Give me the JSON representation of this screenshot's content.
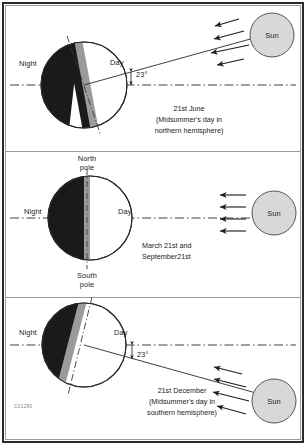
{
  "figure": {
    "reference_code": "C01290",
    "colors": {
      "night": "#1a1a1a",
      "day": "#ffffff",
      "terminator": "#9b9b9b",
      "sun_fill": "#d8d8d8",
      "outline": "#2a2a2a",
      "frame": "#2a2a2a",
      "axis_line": "#3a3a3a"
    }
  },
  "panels": [
    {
      "id": "panel-june",
      "night_label": "Night",
      "day_label": "Day",
      "angle_label": "23°",
      "sun_label": "Sun",
      "caption_lines": [
        "21st June",
        "(Midsummer's day in",
        "northern hemisphere)"
      ],
      "ray_count": 4,
      "tilt_direction": "sun-above-right",
      "axis_tilt_degrees": 23
    },
    {
      "id": "panel-equinox",
      "night_label": "Night",
      "day_label": "Day",
      "north_pole_label_line1": "North",
      "north_pole_label_line2": "pole",
      "south_pole_label_line1": "South",
      "south_pole_label_line2": "pole",
      "sun_label": "Sun",
      "caption_lines": [
        "March 21st and",
        "September21st"
      ],
      "ray_count": 4,
      "tilt_direction": "none",
      "axis_tilt_degrees": 0
    },
    {
      "id": "panel-december",
      "night_label": "Night",
      "day_label": "Day",
      "angle_label": "23°",
      "sun_label": "Sun",
      "caption_lines": [
        "21st December",
        "(Midsummer's day in",
        "southern hemisphere)"
      ],
      "ray_count": 4,
      "tilt_direction": "sun-below-right",
      "axis_tilt_degrees": 23
    }
  ]
}
